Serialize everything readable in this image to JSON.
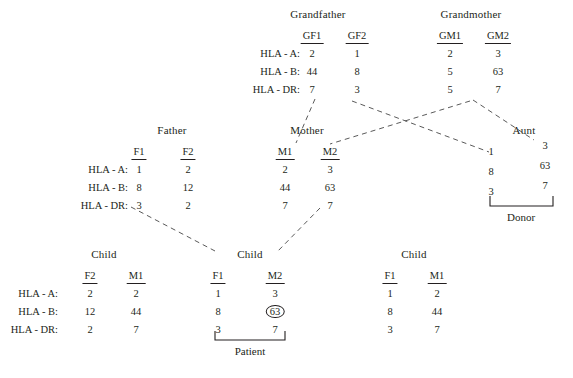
{
  "diagram": {
    "row_labels": [
      "HLA - A:",
      "HLA - B:",
      "HLA - DR:"
    ],
    "line_style": "dashed",
    "line_color": "#5a5a5a"
  },
  "groups": {
    "grandfather": {
      "title": "Grandfather",
      "columns": [
        {
          "head": "GF1",
          "values": [
            "2",
            "44",
            "7"
          ]
        },
        {
          "head": "GF2",
          "values": [
            "1",
            "8",
            "3"
          ]
        }
      ]
    },
    "grandmother": {
      "title": "Grandmother",
      "columns": [
        {
          "head": "GM1",
          "values": [
            "2",
            "5",
            "5"
          ]
        },
        {
          "head": "GM2",
          "values": [
            "3",
            "63",
            "7"
          ]
        }
      ]
    },
    "father": {
      "title": "Father",
      "columns": [
        {
          "head": "F1",
          "values": [
            "1",
            "8",
            "3"
          ]
        },
        {
          "head": "F2",
          "values": [
            "2",
            "12",
            "2"
          ]
        }
      ]
    },
    "mother": {
      "title": "Mother",
      "columns": [
        {
          "head": "M1",
          "values": [
            "2",
            "44",
            "7"
          ]
        },
        {
          "head": "M2",
          "values": [
            "3",
            "63",
            "7"
          ]
        }
      ]
    },
    "aunt": {
      "title": "Aunt",
      "bracket_label": "Donor",
      "columns": [
        {
          "head": "",
          "values": [
            "1",
            "8",
            "3"
          ]
        },
        {
          "head": "",
          "values": [
            "3",
            "63",
            "7"
          ]
        }
      ]
    },
    "child_left": {
      "title": "Child",
      "columns": [
        {
          "head": "F2",
          "values": [
            "2",
            "12",
            "2"
          ]
        },
        {
          "head": "M1",
          "values": [
            "2",
            "44",
            "7"
          ]
        }
      ]
    },
    "child_center": {
      "title": "Child",
      "bracket_label": "Patient",
      "columns": [
        {
          "head": "F1",
          "values": [
            "1",
            "8",
            "3"
          ]
        },
        {
          "head": "M2",
          "values": [
            "3",
            "63",
            "7"
          ]
        }
      ],
      "highlight": {
        "column": 1,
        "row": 1,
        "value": "63"
      }
    },
    "child_right": {
      "title": "Child",
      "columns": [
        {
          "head": "F1",
          "values": [
            "1",
            "8",
            "3"
          ]
        },
        {
          "head": "M1",
          "values": [
            "2",
            "44",
            "7"
          ]
        }
      ]
    }
  }
}
